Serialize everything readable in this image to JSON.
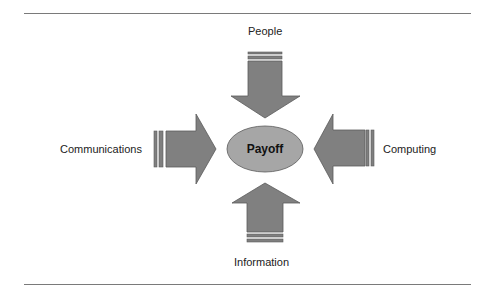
{
  "diagram": {
    "center": {
      "label": "Payoff",
      "fill": "#a6a6a6"
    },
    "inputs": [
      {
        "id": "people",
        "label": "People",
        "direction": "down"
      },
      {
        "id": "communications",
        "label": "Communications",
        "direction": "right"
      },
      {
        "id": "computing",
        "label": "Computing",
        "direction": "left"
      },
      {
        "id": "information",
        "label": "Information",
        "direction": "up"
      }
    ],
    "colors": {
      "arrow_fill": "#7f7f7f",
      "arrow_stroke": "#5a5a5a",
      "rule": "#7a7a7a"
    }
  }
}
